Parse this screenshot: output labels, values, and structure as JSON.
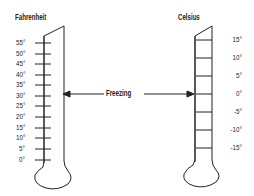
{
  "diagram": {
    "type": "thermometer-comparison",
    "left_thermometer": {
      "title": "Fahrenheit",
      "ticks": [
        "55°",
        "50°",
        "45°",
        "40°",
        "35°",
        "30°",
        "25°",
        "20°",
        "15°",
        "10°",
        "5°",
        "0°"
      ]
    },
    "right_thermometer": {
      "title": "Celsius",
      "ticks": [
        "15°",
        "10°",
        "5°",
        "0°",
        "-5°",
        "-10°",
        "-15°"
      ]
    },
    "annotation": {
      "label": "Freezing",
      "points_to": [
        "30° Fahrenheit",
        "0° Celsius"
      ]
    },
    "colors": {
      "line": "#222222",
      "background": "#ffffff"
    }
  }
}
